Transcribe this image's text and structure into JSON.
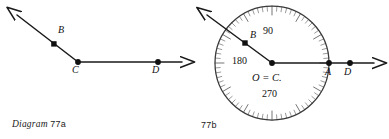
{
  "figure": {
    "type": "geometry-diagram-pair",
    "background_color": "#ffffff",
    "ink_color": "#1a1a1a",
    "tick_color": "#6e6e6e"
  },
  "diagram_a": {
    "caption_italic": "Diagram",
    "caption_number": "77a",
    "description": "Angle BCD with ray CB pointing up-left and ray CD pointing right",
    "points": [
      {
        "name": "B",
        "label": "B",
        "x": 54,
        "y": 44,
        "label_x": 58,
        "label_y": 30
      },
      {
        "name": "C",
        "label": "C",
        "x": 78,
        "y": 62,
        "label_x": 73,
        "label_y": 66
      },
      {
        "name": "D",
        "label": "D",
        "x": 158,
        "y": 62,
        "label_x": 153,
        "label_y": 66
      }
    ],
    "rays": [
      {
        "name": "ray-cb",
        "from": "C",
        "x1": 78,
        "y1": 62,
        "x2": 13,
        "y2": 12,
        "arrow": true
      },
      {
        "name": "ray-cd",
        "from": "C",
        "x1": 78,
        "y1": 62,
        "x2": 193,
        "y2": 62,
        "arrow": true
      }
    ]
  },
  "diagram_b": {
    "caption_number": "77b",
    "description": "Same angle with a protractor circle centered at O = C; ray CD crosses circle at A",
    "circle": {
      "cx": 272,
      "cy": 63,
      "r": 57
    },
    "protractor": {
      "minor_tick_count": 72,
      "minor_tick_length": 5,
      "major_tick_every": 6,
      "major_tick_length": 9
    },
    "degree_labels": [
      {
        "name": "degree-90",
        "text": "90",
        "x": 270,
        "y": 33
      },
      {
        "name": "degree-180",
        "text": "180",
        "x": 240,
        "y": 63
      },
      {
        "name": "degree-270",
        "text": "270",
        "x": 270,
        "y": 96
      }
    ],
    "center_label": {
      "name": "center-label",
      "text": "O = C.",
      "x": 269,
      "y": 80
    },
    "points": [
      {
        "name": "B",
        "label": "B",
        "x": 245,
        "y": 43,
        "label_x": 250,
        "label_y": 35
      },
      {
        "name": "O",
        "label": "",
        "x": 272,
        "y": 63,
        "label_x": 272,
        "label_y": 63
      },
      {
        "name": "A",
        "label": "A",
        "x": 329,
        "y": 63,
        "label_x": 325,
        "label_y": 68
      },
      {
        "name": "D",
        "label": "D",
        "x": 350,
        "y": 63,
        "label_x": 345,
        "label_y": 68
      }
    ],
    "rays": [
      {
        "name": "ray-ob",
        "from": "O",
        "x1": 272,
        "y1": 63,
        "x2": 203,
        "y2": 11,
        "arrow": true
      },
      {
        "name": "ray-od",
        "from": "O",
        "x1": 272,
        "y1": 63,
        "x2": 385,
        "y2": 63,
        "arrow": true
      }
    ]
  }
}
